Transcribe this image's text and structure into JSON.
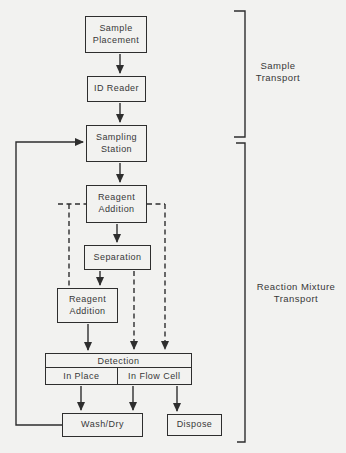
{
  "colors": {
    "background": "#f2f2f0",
    "line": "#2e2e2e",
    "text": "#383838"
  },
  "flowchart": {
    "nodes": [
      {
        "id": "sample-placement",
        "label": "Sample Placement"
      },
      {
        "id": "id-reader",
        "label": "ID Reader"
      },
      {
        "id": "sampling-station",
        "label": "Sampling Station"
      },
      {
        "id": "reagent-addition-1",
        "label": "Reagent Addition"
      },
      {
        "id": "separation",
        "label": "Separation"
      },
      {
        "id": "reagent-addition-2",
        "label": "Reagent Addition"
      },
      {
        "id": "detection",
        "label": "Detection",
        "cells": [
          {
            "label": "In Place"
          },
          {
            "label": "In Flow Cell"
          }
        ]
      },
      {
        "id": "wash-dry",
        "label": "Wash/Dry"
      },
      {
        "id": "dispose",
        "label": "Dispose"
      }
    ],
    "edges": [
      {
        "from": "sample-placement",
        "to": "id-reader",
        "style": "solid-arrow"
      },
      {
        "from": "id-reader",
        "to": "sampling-station",
        "style": "solid-arrow"
      },
      {
        "from": "sampling-station",
        "to": "reagent-addition-1",
        "style": "solid-arrow"
      },
      {
        "from": "reagent-addition-1",
        "to": "separation",
        "style": "solid-arrow"
      },
      {
        "from": "separation",
        "to": "reagent-addition-2",
        "style": "solid-arrow"
      },
      {
        "from": "reagent-addition-2",
        "to": "detection",
        "style": "solid-arrow"
      },
      {
        "from": "detection-in-place",
        "to": "wash-dry",
        "style": "solid-arrow"
      },
      {
        "from": "detection-in-flow-cell",
        "to": "wash-dry",
        "style": "solid-arrow"
      },
      {
        "from": "detection-in-flow-cell",
        "to": "dispose",
        "style": "solid-arrow"
      },
      {
        "from": "wash-dry",
        "to": "sampling-station",
        "style": "solid-arrow-feedback-loop"
      },
      {
        "from": "reagent-addition-1",
        "to": "reagent-addition-2",
        "style": "dashed"
      },
      {
        "from": "reagent-addition-1",
        "to": "detection",
        "style": "dashed-arrow"
      },
      {
        "from": "separation",
        "to": "detection",
        "style": "dashed-arrow"
      }
    ],
    "brackets": [
      {
        "label": "Sample Transport",
        "lines": [
          "Sample",
          "Transport"
        ]
      },
      {
        "label": "Reaction Mixture Transport",
        "lines": [
          "Reaction Mixture",
          "Transport"
        ]
      }
    ]
  }
}
